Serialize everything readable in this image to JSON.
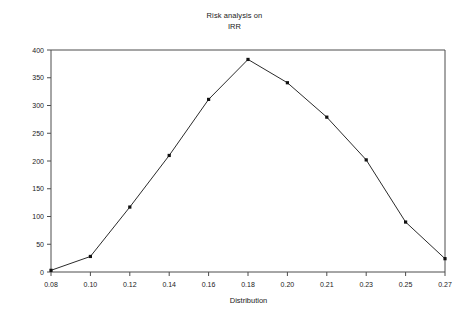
{
  "chart_data": {
    "type": "line",
    "title": "Risk analysis on IRR",
    "title_lines": [
      "Risk analysis on",
      "IRR"
    ],
    "xlabel": "Distribution",
    "ylabel": "Frequency",
    "categories": [
      "0.08",
      "0.10",
      "0.12",
      "0.14",
      "0.16",
      "0.18",
      "0.20",
      "0.21",
      "0.23",
      "0.25",
      "0.27"
    ],
    "x": [
      0.08,
      0.1,
      0.12,
      0.14,
      0.16,
      0.18,
      0.2,
      0.21,
      0.23,
      0.25,
      0.27
    ],
    "values": [
      3,
      28,
      117,
      210,
      311,
      383,
      341,
      279,
      202,
      90,
      24
    ],
    "series": [
      {
        "name": "Frequency",
        "values": [
          3,
          28,
          117,
          210,
          311,
          383,
          341,
          279,
          202,
          90,
          24
        ]
      }
    ],
    "ylim": [
      0,
      400
    ],
    "ytick_values": [
      0,
      50,
      100,
      150,
      200,
      250,
      300,
      350,
      400
    ],
    "ytick_labels": [
      "0",
      "50",
      "100",
      "150",
      "200",
      "250",
      "300",
      "350",
      "400"
    ],
    "xtick_labels": [
      "0.08",
      "0.10",
      "0.12",
      "0.14",
      "0.16",
      "0.18",
      "0.20",
      "0.21",
      "0.23",
      "0.25",
      "0.27"
    ],
    "grid": false,
    "legend": false,
    "marker": "square",
    "line_color": "#2b2b2b",
    "marker_color": "#111111",
    "axis_color": "#4d4d4d",
    "background_color": "#ffffff"
  }
}
